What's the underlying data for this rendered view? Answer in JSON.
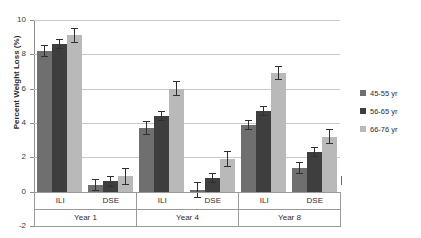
{
  "chart_data": {
    "type": "bar",
    "title": "",
    "xlabel": "",
    "ylabel": "Percent Weight Loss (%)",
    "ylim": [
      -2,
      10
    ],
    "yticks": [
      10,
      8,
      6,
      4,
      2,
      0,
      -2
    ],
    "ytick_labels": [
      "10",
      "8",
      "6",
      "4",
      "2",
      "0",
      "-2"
    ],
    "grid": "horizontal",
    "legend_position": "right",
    "categories": [
      "ILI",
      "DSE",
      "ILI",
      "DSE",
      "ILI",
      "DSE"
    ],
    "group_labels": [
      "Year 1",
      "Year 4",
      "Year 8"
    ],
    "series": [
      {
        "name": "45-55 yr",
        "color": "#6f6f6f",
        "values": [
          8.2,
          0.4,
          3.7,
          0.1,
          3.9,
          1.4
        ],
        "errors": [
          0.35,
          0.35,
          0.4,
          0.45,
          0.3,
          0.35
        ]
      },
      {
        "name": "56-65 yr",
        "color": "#3e3e3e",
        "values": [
          8.6,
          0.6,
          4.4,
          0.8,
          4.7,
          2.3
        ],
        "errors": [
          0.3,
          0.3,
          0.3,
          0.3,
          0.3,
          0.3
        ]
      },
      {
        "name": "66-76 yr",
        "color": "#b9b9b9",
        "values": [
          9.1,
          0.9,
          6.0,
          1.9,
          6.9,
          3.2
        ],
        "errors": [
          0.45,
          0.5,
          0.45,
          0.45,
          0.4,
          0.45
        ]
      }
    ]
  },
  "legend": {
    "items": [
      {
        "label": "45-55 yr",
        "color": "#6f6f6f"
      },
      {
        "label": "56-65 yr",
        "color": "#3e3e3e"
      },
      {
        "label": "66-76 yr",
        "color": "#b9b9b9"
      }
    ]
  }
}
